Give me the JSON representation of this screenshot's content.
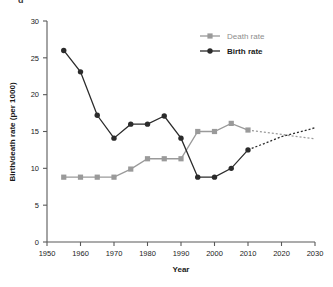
{
  "figure": {
    "top_fragment": "g"
  },
  "legend": {
    "position": "top-right",
    "items": [
      {
        "label": "Death rate",
        "color": "#9a9a9a",
        "marker": "square"
      },
      {
        "label": "Birth rate",
        "color": "#2b2b2b",
        "marker": "circle"
      }
    ]
  },
  "chart_data": {
    "type": "line",
    "title": "",
    "xlabel": "Year",
    "ylabel": "Birth/death rate (per 1000)",
    "xlim": [
      1950,
      2030
    ],
    "ylim": [
      0,
      30
    ],
    "xticks": [
      1950,
      1960,
      1970,
      1980,
      1990,
      2000,
      2010,
      2020,
      2030
    ],
    "yticks": [
      0,
      5,
      10,
      15,
      20,
      25,
      30
    ],
    "grid": false,
    "legend_position": "top-right",
    "series": [
      {
        "name": "Death rate",
        "color": "#9a9a9a",
        "marker": "square",
        "x": [
          1955,
          1960,
          1965,
          1970,
          1975,
          1980,
          1985,
          1990,
          1995,
          2000,
          2005,
          2010
        ],
        "values": [
          8.8,
          8.8,
          8.8,
          8.8,
          9.9,
          11.3,
          11.3,
          11.3,
          15.0,
          15.0,
          16.1,
          15.2
        ],
        "projection": {
          "style": "dashed",
          "x": [
            2010,
            2020,
            2030
          ],
          "values": [
            15.2,
            14.6,
            14.0
          ]
        }
      },
      {
        "name": "Birth rate",
        "color": "#2b2b2b",
        "marker": "circle",
        "x": [
          1955,
          1960,
          1965,
          1970,
          1975,
          1980,
          1985,
          1990,
          1995,
          2000,
          2005,
          2010
        ],
        "values": [
          26.0,
          23.1,
          17.2,
          14.1,
          16.0,
          16.0,
          17.1,
          14.1,
          8.8,
          8.8,
          10.0,
          12.5
        ],
        "projection": {
          "style": "dashed",
          "x": [
            2010,
            2020,
            2030
          ],
          "values": [
            12.5,
            14.3,
            15.5
          ]
        }
      }
    ]
  }
}
